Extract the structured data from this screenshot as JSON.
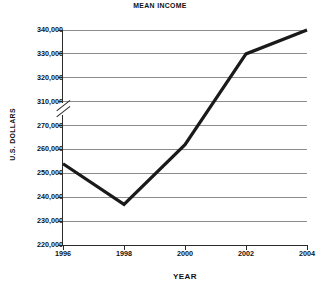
{
  "chart_data": {
    "type": "line",
    "title": "MEAN INCOME",
    "xlabel": "YEAR",
    "ylabel": "U.S. DOLLARS",
    "x": [
      1996,
      1998,
      2000,
      2002,
      2004
    ],
    "values": [
      254000,
      237000,
      262000,
      330000,
      340000
    ],
    "series": [
      {
        "name": "Mean income",
        "values": [
          254000,
          237000,
          262000,
          330000,
          340000
        ]
      }
    ],
    "xtick_labels": [
      "1996",
      "1998",
      "2000",
      "2002",
      "2004"
    ],
    "ytick_labels": [
      "340,000",
      "330,000",
      "320,000",
      "310,000",
      "270,000",
      "260,000",
      "250,000",
      "240,000",
      "230,000",
      "220,000"
    ],
    "ytick_values": [
      340000,
      330000,
      320000,
      310000,
      270000,
      260000,
      250000,
      240000,
      230000,
      220000
    ],
    "ylim": [
      220000,
      340000
    ],
    "xlim": [
      1996,
      2004
    ],
    "axis_break": {
      "present": true,
      "between": [
        310000,
        270000
      ],
      "style": "double-slash"
    },
    "grid": true,
    "grid_axis": "y",
    "legend": false,
    "line_color": "#1a1a1a",
    "grid_color": "#8c8c8c",
    "axis_color": "#2b2b2b",
    "background": "#ffffff",
    "markers": false,
    "note": "Vertices drawn at 1996, 1998, 2002 and 2004; the 1998-2002 rise is a single straight segment passing through 2000."
  }
}
